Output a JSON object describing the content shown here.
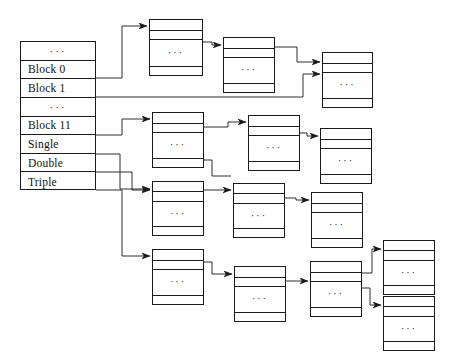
{
  "diagram": {
    "ellipsis": "···",
    "stroke_color": "#1a1a1a",
    "background_color": "#fefefe",
    "width": 454,
    "height": 355
  },
  "inode": {
    "name": "inode-block-pointer-table",
    "x": 20,
    "y": 41,
    "width": 76,
    "height": 149,
    "rows": [
      {
        "label": "···",
        "kind": "ellipsis"
      },
      {
        "label": "Block 0",
        "kind": "direct"
      },
      {
        "label": "Block 1",
        "kind": "direct"
      },
      {
        "label": "···",
        "kind": "ellipsis"
      },
      {
        "label": "Block 11",
        "kind": "direct"
      },
      {
        "label": "Single",
        "kind": "single-indirect"
      },
      {
        "label": "Double",
        "kind": "double-indirect"
      },
      {
        "label": "Triple",
        "kind": "triple-indirect"
      }
    ]
  },
  "blocks": [
    {
      "id": "b1",
      "name": "block-single-top-1",
      "x": 149,
      "y": 19,
      "w": 54,
      "h": 57
    },
    {
      "id": "b2",
      "name": "block-single-top-2",
      "x": 223,
      "y": 37,
      "w": 52,
      "h": 56
    },
    {
      "id": "b3",
      "name": "block-single-top-3",
      "x": 322,
      "y": 52,
      "w": 51,
      "h": 56
    },
    {
      "id": "b4",
      "name": "block-double-mid-1",
      "x": 152,
      "y": 112,
      "w": 52,
      "h": 56
    },
    {
      "id": "b5",
      "name": "block-double-mid-2",
      "x": 248,
      "y": 115,
      "w": 52,
      "h": 56
    },
    {
      "id": "b6",
      "name": "block-double-mid-3",
      "x": 320,
      "y": 128,
      "w": 52,
      "h": 56
    },
    {
      "id": "b7",
      "name": "block-triple-l1-1",
      "x": 152,
      "y": 181,
      "w": 52,
      "h": 55
    },
    {
      "id": "b8",
      "name": "block-triple-l1-2",
      "x": 233,
      "y": 183,
      "w": 52,
      "h": 55
    },
    {
      "id": "b9",
      "name": "block-triple-l1-3",
      "x": 311,
      "y": 192,
      "w": 52,
      "h": 56
    },
    {
      "id": "b10",
      "name": "block-triple-l2-1",
      "x": 152,
      "y": 249,
      "w": 52,
      "h": 56
    },
    {
      "id": "b11",
      "name": "block-triple-l2-2",
      "x": 234,
      "y": 266,
      "w": 52,
      "h": 56
    },
    {
      "id": "b12",
      "name": "block-triple-l2-3",
      "x": 310,
      "y": 261,
      "w": 52,
      "h": 56
    },
    {
      "id": "b13",
      "name": "block-triple-leaf-1",
      "x": 383,
      "y": 240,
      "w": 52,
      "h": 55
    },
    {
      "id": "b14",
      "name": "block-triple-leaf-2",
      "x": 383,
      "y": 296,
      "w": 52,
      "h": 55
    }
  ],
  "connections": [
    {
      "name": "wire-block0-to-b1",
      "from": "Block 0",
      "to": "b1"
    },
    {
      "name": "wire-b1-to-b2",
      "from": "b1",
      "to": "b2"
    },
    {
      "name": "wire-b2-to-b3",
      "from": "b2",
      "to": "b3"
    },
    {
      "name": "wire-block1-to-b3",
      "from": "Block 1",
      "to": "b3"
    },
    {
      "name": "wire-block11-to-b4",
      "from": "Block 11",
      "to": "b4"
    },
    {
      "name": "wire-b4-to-b5",
      "from": "b4",
      "to": "b5"
    },
    {
      "name": "wire-b5-to-b6",
      "from": "b5",
      "to": "b6"
    },
    {
      "name": "wire-single-to-b7",
      "from": "Single",
      "to": "b7"
    },
    {
      "name": "wire-b7-to-b8",
      "from": "b7",
      "to": "b8"
    },
    {
      "name": "wire-b8-to-b9",
      "from": "b8",
      "to": "b9"
    },
    {
      "name": "wire-b4-to-b8",
      "from": "b4",
      "to": "b8"
    },
    {
      "name": "wire-double-to-b10",
      "from": "Double",
      "to": "b10"
    },
    {
      "name": "wire-b10-to-b11",
      "from": "b10",
      "to": "b11"
    },
    {
      "name": "wire-b11-to-b12",
      "from": "b11",
      "to": "b12"
    },
    {
      "name": "wire-triple-to-b10b",
      "from": "Triple",
      "to": "b10"
    },
    {
      "name": "wire-b12-to-b13",
      "from": "b12",
      "to": "b13"
    },
    {
      "name": "wire-b12-to-b14",
      "from": "b12",
      "to": "b14"
    }
  ]
}
